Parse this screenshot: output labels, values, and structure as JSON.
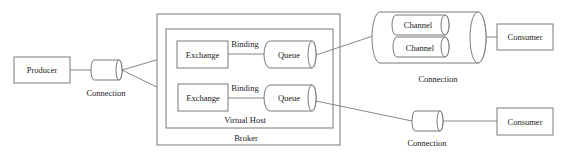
{
  "diagram": {
    "producer": {
      "label": "Producer"
    },
    "producer_connection": {
      "label": "Connection"
    },
    "broker": {
      "label": "Broker",
      "virtual_host": {
        "label": "Virtual Host",
        "rows": [
          {
            "exchange": "Exchange",
            "binding": "Binding",
            "queue": "Queue"
          },
          {
            "exchange": "Exchange",
            "binding": "Binding",
            "queue": "Queue"
          }
        ]
      }
    },
    "multi_channel_connection": {
      "label": "Connection",
      "channels": [
        "Channel",
        "Channel"
      ]
    },
    "single_connection": {
      "label": "Connection"
    },
    "consumers": [
      {
        "label": "Consumer"
      },
      {
        "label": "Consumer"
      }
    ]
  }
}
